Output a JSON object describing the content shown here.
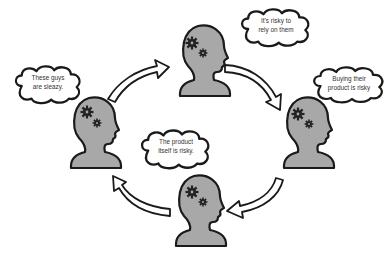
{
  "diagram": {
    "type": "cycle",
    "colors": {
      "head_fill": "#a8a8a8",
      "outline": "#1a1a1a",
      "gear": "#222222",
      "bubble_fill": "#ffffff",
      "arrow_fill": "#ffffff"
    },
    "nodes": [
      {
        "id": "top",
        "thought_lines": [
          "It's risky to",
          "rely on them"
        ]
      },
      {
        "id": "right",
        "thought_lines": [
          "Buying their",
          "product is risky"
        ]
      },
      {
        "id": "bottom",
        "thought_lines": [
          "The product",
          "itself is risky."
        ]
      },
      {
        "id": "left",
        "thought_lines": [
          "These guys",
          "are sleazy."
        ]
      }
    ],
    "arrows": [
      {
        "from": "left",
        "to": "top",
        "direction": "clockwise"
      },
      {
        "from": "top",
        "to": "right",
        "direction": "clockwise"
      },
      {
        "from": "right",
        "to": "bottom",
        "direction": "clockwise"
      },
      {
        "from": "bottom",
        "to": "left",
        "direction": "clockwise"
      }
    ]
  }
}
